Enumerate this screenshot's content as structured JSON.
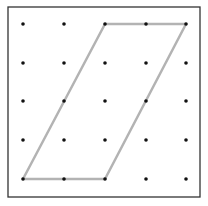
{
  "diagram": {
    "type": "geoboard",
    "frame": {
      "x": 8,
      "y": 7,
      "width": 192,
      "height": 190,
      "stroke": "#333333"
    },
    "grid": {
      "columns": 5,
      "rows": 5,
      "x": [
        23,
        64,
        105,
        146,
        186
      ],
      "y": [
        24,
        63,
        101,
        140,
        179
      ],
      "dot_color": "#111111",
      "dot_radius": 1.8
    },
    "shape": {
      "name": "parallelogram",
      "stroke": "#b3b3b3",
      "stroke_width": 2.5,
      "vertices_grid": [
        [
          2,
          0
        ],
        [
          4,
          0
        ],
        [
          2,
          4
        ],
        [
          0,
          4
        ]
      ],
      "vertices_px": [
        [
          105,
          24
        ],
        [
          186,
          24
        ],
        [
          105,
          179
        ],
        [
          23,
          179
        ]
      ]
    }
  }
}
